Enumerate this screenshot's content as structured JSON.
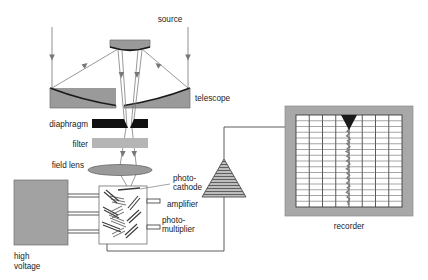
{
  "figure": {
    "type": "instrument-schematic",
    "background_color": "#ffffff",
    "line_color": "#555555",
    "text_color": "#1a1a1a"
  },
  "labels": {
    "source": "source",
    "telescope": "telescope",
    "diaphragm": "diaphragm",
    "filter": "filter",
    "field_lens": "field lens",
    "photocathode_line1": "photo-",
    "photocathode_line2": "cathode",
    "photomultiplier_line1": "photo-",
    "photomultiplier_line2": "multiplier",
    "high_voltage_line1": "high",
    "high_voltage_line2": "voltage",
    "amplifier": "amplifier",
    "recorder": "recorder"
  },
  "colors": {
    "mirror_fill": "#9a9a9a",
    "mirror_edge": "#1a1a1a",
    "diaphragm_fill": "#111111",
    "filter_fill": "#b5b5b5",
    "lens_fill": "#9a9a9a",
    "hv_box_fill": "#a2a2a2",
    "recorder_frame_fill": "#a8a8a8",
    "chart_paper_fill": "#ffffff",
    "grid_line_color": "#3c3c3c",
    "pen_marker_fill": "#1a1a1a",
    "trace_color": "#7a7a7a",
    "amplifier_fill": "#8f8f8f",
    "wire_color": "#4a4a4a",
    "ray_color": "#777777"
  },
  "components": {
    "telescope": {
      "name": "Cassegrain telescope",
      "secondary_mirror": {
        "x": 110,
        "y": 40,
        "width": 40,
        "height": 11
      },
      "primary_mirror_left": {
        "x": 50,
        "y": 86,
        "width": 66,
        "height": 22
      },
      "primary_mirror_right": {
        "x": 124,
        "y": 86,
        "width": 66,
        "height": 22
      },
      "incoming_ray_count": 2
    },
    "diaphragm": {
      "x": 92,
      "y": 119,
      "width": 56,
      "height": 9,
      "gap": "central aperture"
    },
    "filter": {
      "x": 92,
      "y": 138,
      "width": 56,
      "height": 10
    },
    "field_lens": {
      "cx": 120,
      "cy": 170,
      "rx": 32,
      "ry": 5.5
    },
    "photomultiplier": {
      "x": 99,
      "y": 186,
      "width": 48,
      "height": 58,
      "dynode_stages": 5,
      "electrode_pins": 3
    },
    "high_voltage": {
      "x": 14,
      "y": 180,
      "width": 54,
      "height": 65,
      "wire_count": 3
    },
    "amplifier": {
      "apex_x": 224,
      "apex_y": 159,
      "base_y": 197,
      "half_width": 22
    },
    "recorder": {
      "frame": {
        "x": 285,
        "y": 106,
        "width": 128,
        "height": 110
      },
      "paper": {
        "x": 296,
        "y": 115,
        "width": 106,
        "height": 92
      },
      "grid_columns": 8,
      "grid_rows": 16,
      "pen_marker_x": 348,
      "trace_label": "recorded signal trace"
    }
  },
  "chart_data": {
    "type": "line",
    "title": "recorder",
    "xlabel": "",
    "ylabel": "",
    "grid": true,
    "grid_columns": 8,
    "grid_rows": 16,
    "series": [
      {
        "name": "signal trace",
        "orientation": "vertical",
        "description": "Noisy near-vertical pen trace descending from pen marker at top",
        "values": [
          0.0,
          0.6,
          -0.4,
          0.8,
          0.2,
          -0.6,
          0.5,
          1.0,
          -0.2,
          0.7,
          -0.5,
          0.3,
          0.9,
          -0.3,
          0.4,
          -0.8,
          0.6,
          0.1,
          -0.5,
          0.8,
          0.3,
          -0.6,
          0.5,
          0.9,
          -0.2,
          0.4,
          -0.7,
          0.6,
          0.2,
          -0.4,
          0.8,
          0.0,
          -0.5,
          0.7,
          0.3,
          -0.6,
          0.4,
          0.9,
          -0.3,
          0.5,
          0.1,
          -0.7,
          0.6,
          0.2,
          -0.4,
          0.8,
          0.5,
          -0.2,
          0.3,
          0.0
        ]
      }
    ],
    "marker": {
      "type": "triangle-down",
      "label": "recorder pen",
      "x_fraction": 0.49
    }
  },
  "signal_path": [
    "source",
    "telescope",
    "diaphragm",
    "filter",
    "field lens",
    "photo-cathode",
    "photo-multiplier",
    "amplifier",
    "recorder"
  ]
}
